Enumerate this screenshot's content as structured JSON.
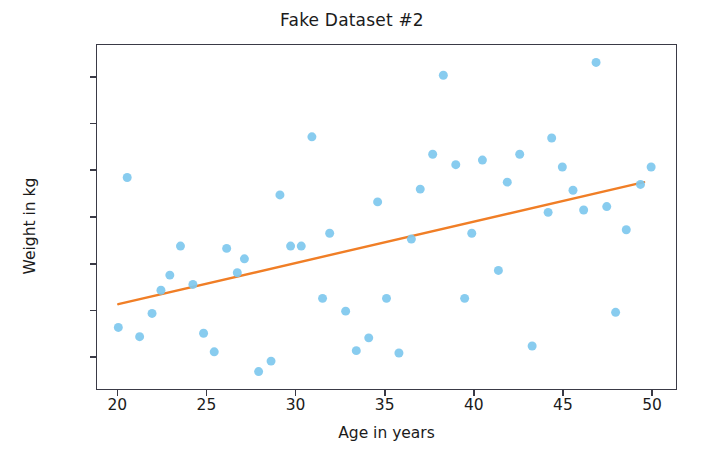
{
  "chart_data": {
    "type": "scatter",
    "title": "Fake Dataset #2",
    "xlabel": "Age in years",
    "ylabel": "Weight in kg",
    "xlim": [
      18.8,
      51.4
    ],
    "ylim": [
      66.6,
      81.4
    ],
    "grid": false,
    "legend": null,
    "xticks": [
      20,
      25,
      30,
      35,
      40,
      45,
      50
    ],
    "yticks": [
      68,
      70,
      72,
      74,
      76,
      78,
      80
    ],
    "xtick_labels": [
      "20",
      "25",
      "30",
      "35",
      "40",
      "45",
      "50"
    ],
    "ytick_labels": [
      "68",
      "70",
      "72",
      "74",
      "76",
      "78",
      "80"
    ],
    "marker_color": "#7ec8ee",
    "marker_size": 9,
    "series": [
      {
        "name": "observations",
        "type": "scatter",
        "points": [
          [
            20.0,
            69.25
          ],
          [
            20.5,
            75.7
          ],
          [
            21.2,
            68.85
          ],
          [
            21.9,
            69.85
          ],
          [
            22.4,
            70.85
          ],
          [
            22.9,
            71.5
          ],
          [
            23.5,
            72.75
          ],
          [
            24.2,
            71.1
          ],
          [
            24.8,
            69.0
          ],
          [
            25.4,
            68.2
          ],
          [
            26.1,
            72.65
          ],
          [
            26.7,
            71.6
          ],
          [
            27.1,
            72.2
          ],
          [
            27.9,
            67.35
          ],
          [
            28.6,
            67.8
          ],
          [
            29.1,
            74.95
          ],
          [
            29.7,
            72.75
          ],
          [
            30.3,
            72.75
          ],
          [
            30.9,
            77.45
          ],
          [
            31.5,
            70.5
          ],
          [
            31.9,
            73.3
          ],
          [
            32.8,
            69.95
          ],
          [
            33.4,
            68.25
          ],
          [
            34.1,
            68.8
          ],
          [
            34.6,
            74.65
          ],
          [
            35.1,
            70.5
          ],
          [
            35.8,
            68.15
          ],
          [
            36.5,
            73.05
          ],
          [
            37.0,
            75.2
          ],
          [
            37.7,
            76.7
          ],
          [
            38.3,
            80.1
          ],
          [
            39.0,
            76.25
          ],
          [
            39.5,
            70.5
          ],
          [
            39.9,
            73.3
          ],
          [
            40.5,
            76.45
          ],
          [
            41.4,
            71.7
          ],
          [
            41.9,
            75.5
          ],
          [
            42.6,
            76.7
          ],
          [
            43.3,
            68.45
          ],
          [
            44.2,
            74.2
          ],
          [
            44.4,
            77.4
          ],
          [
            45.0,
            76.15
          ],
          [
            45.6,
            75.15
          ],
          [
            46.2,
            74.3
          ],
          [
            46.9,
            80.65
          ],
          [
            47.5,
            74.45
          ],
          [
            48.0,
            69.9
          ],
          [
            48.6,
            73.45
          ],
          [
            49.4,
            75.4
          ],
          [
            50.0,
            76.15
          ]
        ]
      },
      {
        "name": "trend-line",
        "type": "line",
        "color": "#f07e26",
        "linewidth": 2.4,
        "points": [
          [
            20.0,
            70.25
          ],
          [
            49.6,
            75.5
          ]
        ]
      }
    ]
  }
}
